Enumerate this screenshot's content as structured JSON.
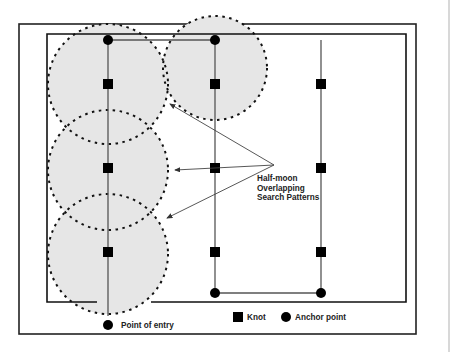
{
  "diagram": {
    "annotation": {
      "lines": [
        "Half-moon",
        "Overlapping",
        "Search Patterns"
      ]
    },
    "legend": {
      "knot_label": "Knot",
      "anchor_label": "Anchor point",
      "entry_label": "Point of entry"
    },
    "colors": {
      "frame": "#222222",
      "line": "#555555",
      "circle_fill": "#e6e6e6",
      "circle_stroke": "#111111",
      "marker": "#000000"
    },
    "search_lines": [
      {
        "id": "line-1",
        "x": 108,
        "y_top": 40,
        "y_bottom": 316,
        "knots": [
          84,
          168,
          252
        ],
        "anchors": [
          40
        ]
      },
      {
        "id": "line-2",
        "x": 215,
        "y_top": 40,
        "y_bottom": 293,
        "knots": [
          84,
          168,
          252
        ],
        "anchors": [
          40,
          293
        ]
      },
      {
        "id": "line-3",
        "x": 321,
        "y_top": 40,
        "y_bottom": 293,
        "knots": [
          84,
          168,
          252
        ],
        "anchors": [
          293
        ]
      }
    ],
    "search_circles": [
      {
        "cx": 108,
        "cy": 84,
        "r": 60
      },
      {
        "cx": 215,
        "cy": 68,
        "r": 52
      },
      {
        "cx": 108,
        "cy": 170,
        "r": 60
      },
      {
        "cx": 108,
        "cy": 254,
        "r": 60
      }
    ]
  }
}
